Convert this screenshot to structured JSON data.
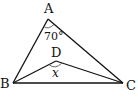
{
  "diagram": {
    "type": "geometry-triangle",
    "points": {
      "A": {
        "label": "A",
        "x": 48,
        "y": 19
      },
      "B": {
        "label": "B",
        "x": 13,
        "y": 83
      },
      "C": {
        "label": "C",
        "x": 123,
        "y": 83
      },
      "D": {
        "label": "D",
        "x": 56,
        "y": 61
      }
    },
    "segments": [
      "AB",
      "AC",
      "BC",
      "BD",
      "DC"
    ],
    "angles": {
      "A": {
        "label": "70°"
      },
      "D": {
        "label": "x"
      }
    },
    "colors": {
      "stroke": "#111111",
      "arc": "#555555"
    }
  }
}
